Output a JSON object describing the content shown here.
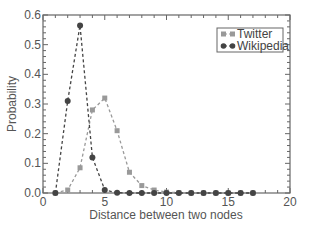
{
  "chart_data": {
    "type": "line",
    "title": "",
    "xlabel": "Distance between two nodes",
    "ylabel": "Probability",
    "xlim": [
      0,
      20
    ],
    "ylim": [
      0,
      0.6
    ],
    "xticks": [
      0,
      5,
      10,
      15,
      20
    ],
    "yticks": [
      0.0,
      0.1,
      0.2,
      0.3,
      0.4,
      0.5,
      0.6
    ],
    "ytick_labels": [
      "0.0",
      "0.1",
      "0.2",
      "0.3",
      "0.4",
      "0.5",
      "0.6"
    ],
    "grid": false,
    "legend_position": "upper right",
    "series": [
      {
        "name": "Twitter",
        "marker": "square",
        "color": "#999999",
        "linestyle": "dashed",
        "x": [
          1,
          2,
          3,
          4,
          5,
          6,
          7,
          8,
          9,
          10,
          11,
          12,
          13,
          14,
          15,
          16,
          17
        ],
        "values": [
          0.0,
          0.01,
          0.085,
          0.28,
          0.32,
          0.21,
          0.07,
          0.025,
          0.01,
          0.003,
          0.001,
          0.0,
          0.0,
          0.0,
          0.0,
          0.0,
          0.0
        ]
      },
      {
        "name": "Wikipedia",
        "marker": "circle",
        "color": "#444444",
        "linestyle": "dashed",
        "x": [
          1,
          2,
          3,
          4,
          5,
          6,
          7,
          8,
          9,
          10,
          11,
          12,
          13,
          14,
          15,
          16,
          17
        ],
        "values": [
          0.0,
          0.31,
          0.565,
          0.12,
          0.01,
          0.001,
          0.0,
          0.0,
          0.0,
          0.0,
          0.0,
          0.0,
          0.0,
          0.0,
          0.0,
          0.0,
          0.0
        ]
      }
    ]
  }
}
